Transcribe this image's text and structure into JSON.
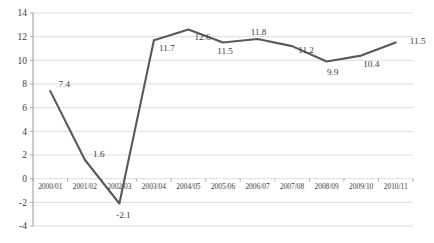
{
  "chart_data": {
    "type": "line",
    "title": "",
    "subtitle": "",
    "xlabel": "",
    "ylabel": "",
    "categories": [
      "2000/01",
      "2001/02",
      "2002/03",
      "2003/04",
      "2004/05",
      "2005/06",
      "2006/07",
      "2007/08",
      "2008/09",
      "2009/10",
      "2010/11"
    ],
    "series": [
      {
        "name": "",
        "values": [
          7.4,
          1.6,
          -2.1,
          11.7,
          12.6,
          11.5,
          11.8,
          11.2,
          9.9,
          10.4,
          11.5
        ],
        "color": "#595959"
      }
    ],
    "data_labels": [
      "7.4",
      "1.6",
      "-2.1",
      "11.7",
      "12.6",
      "11.5",
      "11.8",
      "11.2",
      "9.9",
      "10.4",
      "11.5"
    ],
    "ylim": [
      -4,
      14
    ],
    "ytick_step": 2,
    "ytick_labels": [
      "14",
      "12",
      "10",
      "8",
      "6",
      "4",
      "2",
      "0",
      "-2",
      "-4"
    ],
    "grid": true,
    "grid_color": "#d4d4d4",
    "legend": "none",
    "axis_color": "#9a9a9a",
    "background": "#ffffff"
  }
}
